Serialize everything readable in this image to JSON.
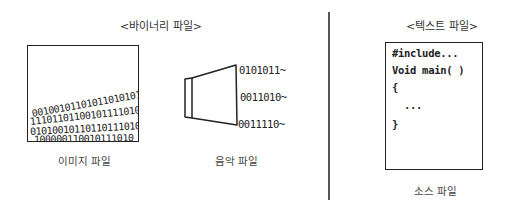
{
  "binary_section": {
    "title": "<바이너리 파일>",
    "image_file": {
      "caption": "이미지 파일",
      "rows": [
        "1011",
        "0101100101",
        "0010010110",
        "11011110",
        "0110011000"
      ],
      "bits_lines": [
        {
          "text": "0010010110101101010111",
          "left": 4,
          "top": 58,
          "rotate": -12
        },
        {
          "text": "111011011001011110100",
          "left": 4,
          "top": 70,
          "rotate": -8
        },
        {
          "text": "01010010110110111010",
          "left": 4,
          "top": 82,
          "rotate": -4
        },
        {
          "text": "100000110010111010",
          "left": 6,
          "top": 90,
          "rotate": -2
        }
      ]
    },
    "audio_file": {
      "caption": "음악 파일",
      "lines": [
        "0101011~",
        "0011010~",
        "0011110~"
      ]
    }
  },
  "text_section": {
    "title": "<텍스트 파일>",
    "source_file": {
      "caption": "소스 파일",
      "code_lines": [
        "#include...",
        "Void main( )",
        "{",
        "  ...",
        "}"
      ]
    }
  }
}
